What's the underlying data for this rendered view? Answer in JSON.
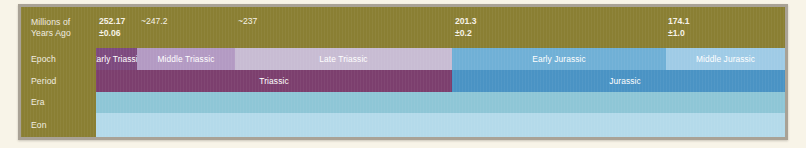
{
  "figure": {
    "kind": "geologic-timescale",
    "axis_unit_label": "Millions of\nYears Ago",
    "background_color": "#f8f4e8",
    "frame_color": "#a9a296",
    "header_color": "#8a7f33"
  },
  "rows": {
    "mya": {
      "label": "Millions of\nYears Ago"
    },
    "epoch": {
      "label": "Epoch"
    },
    "period": {
      "label": "Period"
    },
    "era": {
      "label": "Era"
    },
    "eon": {
      "label": "Eon"
    }
  },
  "chart_data": {
    "type": "bar",
    "title": "",
    "xlabel": "Millions of Years Ago",
    "ylabel": "",
    "grid": false,
    "legend": "none",
    "orientation": "horizontal",
    "axis_direction": "older-to-younger (left to right)",
    "xlim": [
      252.17,
      160.0
    ],
    "axis_ticks": [
      {
        "value": "252.17",
        "uncertainty": "±0.06",
        "display": "252.17\n±0.06",
        "x_px": 96
      },
      {
        "value": "~247.2",
        "uncertainty": "",
        "display": "~247.2",
        "x_px": 138
      },
      {
        "value": "~237",
        "uncertainty": "",
        "display": "~237",
        "x_px": 235
      },
      {
        "value": "201.3",
        "uncertainty": "±0.2",
        "display": "201.3\n±0.2",
        "x_px": 452
      },
      {
        "value": "174.1",
        "uncertainty": "±1.0",
        "display": "174.1\n±1.0",
        "x_px": 665
      },
      {
        "value": "163.5",
        "uncertainty": "±1.0",
        "display": "163.5\n±1.0",
        "x_px": 783
      }
    ],
    "series": [
      {
        "name": "Epoch",
        "segments": [
          {
            "label": "Early Triassic",
            "start": 252.17,
            "end": 247.2,
            "left_px": 93,
            "width_px": 41,
            "color": "#7d4a7f"
          },
          {
            "label": "Middle Triassic",
            "start": 247.2,
            "end": 237.0,
            "left_px": 134,
            "width_px": 98,
            "color": "#b39ac3"
          },
          {
            "label": "Late Triassic",
            "start": 237.0,
            "end": 201.3,
            "left_px": 232,
            "width_px": 217,
            "color": "#c8bcd3"
          },
          {
            "label": "Early Jurassic",
            "start": 201.3,
            "end": 174.1,
            "left_px": 449,
            "width_px": 214,
            "color": "#70b0d6"
          },
          {
            "label": "Middle Jurassic",
            "start": 174.1,
            "end": 163.5,
            "left_px": 663,
            "width_px": 119,
            "color": "#9fcbe6"
          },
          {
            "label": "",
            "start": 163.5,
            "end": 160.0,
            "left_px": 782,
            "width_px": 13,
            "color": "#bfdcef"
          }
        ]
      },
      {
        "name": "Period",
        "segments": [
          {
            "label": "Triassic",
            "start": 252.17,
            "end": 201.3,
            "left_px": 93,
            "width_px": 356,
            "color": "#7c3f6e"
          },
          {
            "label": "Jurassic",
            "start": 201.3,
            "end": 160.0,
            "left_px": 449,
            "width_px": 346,
            "color": "#4a93c4"
          }
        ]
      },
      {
        "name": "Era",
        "segments": [
          {
            "label": "",
            "start": 252.17,
            "end": 160.0,
            "left_px": 93,
            "width_px": 702,
            "color": "#8ec6d6"
          }
        ]
      },
      {
        "name": "Eon",
        "segments": [
          {
            "label": "",
            "start": 252.17,
            "end": 160.0,
            "left_px": 93,
            "width_px": 702,
            "color": "#b4daea"
          }
        ]
      }
    ]
  }
}
